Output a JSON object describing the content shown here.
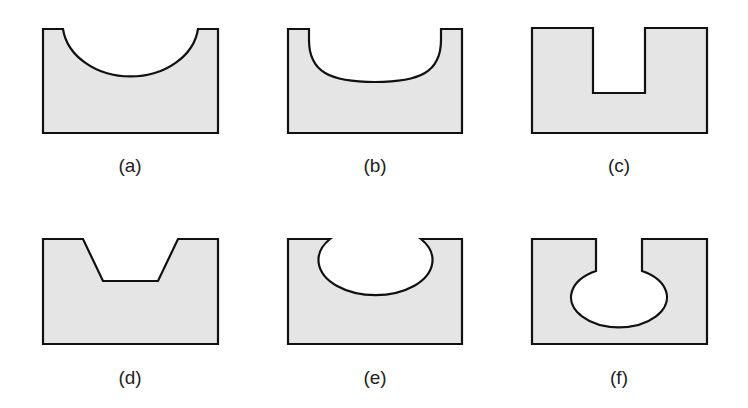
{
  "figure": {
    "fill_color": "#e5e5e5",
    "stroke_color": "#111111",
    "panels": [
      {
        "id": "a",
        "label": "(a)",
        "shape": "semicircular-groove"
      },
      {
        "id": "b",
        "label": "(b)",
        "shape": "U-shaped-rounded-groove"
      },
      {
        "id": "c",
        "label": "(c)",
        "shape": "rectangular-slot"
      },
      {
        "id": "d",
        "label": "(d)",
        "shape": "trapezoidal-dovetail-groove"
      },
      {
        "id": "e",
        "label": "(e)",
        "shape": "elliptical-undercut-groove"
      },
      {
        "id": "f",
        "label": "(f)",
        "shape": "keyhole-slot-with-elliptical-cavity"
      }
    ]
  }
}
